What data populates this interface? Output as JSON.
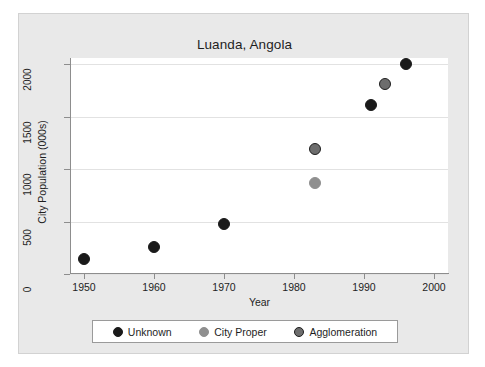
{
  "chart_data": {
    "type": "scatter",
    "title": "Luanda, Angola",
    "xlabel": "Year",
    "ylabel": "City Population (000s)",
    "xlim": [
      1948,
      2002
    ],
    "ylim": [
      0,
      2060
    ],
    "xticks": [
      1950,
      1960,
      1970,
      1980,
      1990,
      2000
    ],
    "yticks": [
      0,
      500,
      1000,
      1500,
      2000
    ],
    "grid": "horizontal",
    "legend_position": "bottom",
    "series": [
      {
        "name": "Unknown",
        "color": "#1a1a1a",
        "edge_color": "#1a1a1a",
        "points": [
          {
            "x": 1950,
            "y": 140
          },
          {
            "x": 1960,
            "y": 255
          },
          {
            "x": 1970,
            "y": 480
          },
          {
            "x": 1991,
            "y": 1615
          },
          {
            "x": 1996,
            "y": 2000
          }
        ]
      },
      {
        "name": "City Proper",
        "color": "#8f8f8f",
        "edge_color": "#8f8f8f",
        "points": [
          {
            "x": 1983,
            "y": 870
          }
        ]
      },
      {
        "name": "Agglomeration",
        "color": "#6d6d6d",
        "edge_color": "#1e1e1e",
        "points": [
          {
            "x": 1983,
            "y": 1190
          },
          {
            "x": 1993,
            "y": 1810
          }
        ]
      }
    ]
  },
  "legend": {
    "items": [
      {
        "label": "Unknown"
      },
      {
        "label": "City Proper"
      },
      {
        "label": "Agglomeration"
      }
    ]
  }
}
